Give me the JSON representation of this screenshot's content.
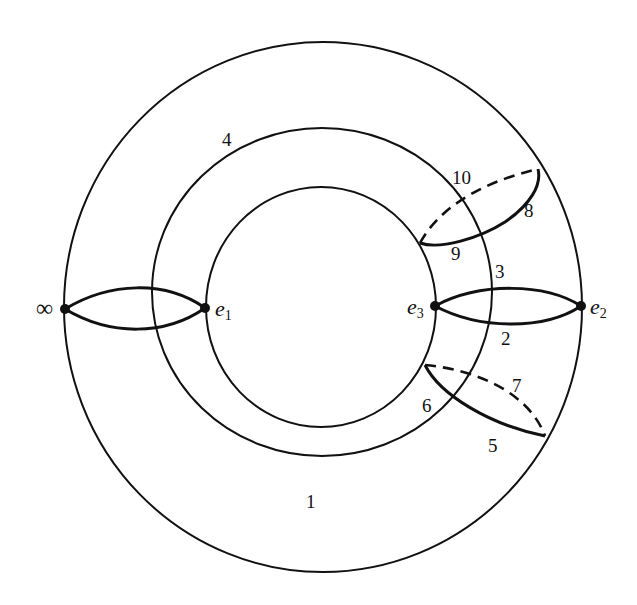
{
  "figure": {
    "circles": [
      {
        "id": "outer",
        "label": "1"
      },
      {
        "id": "middle",
        "label": "4"
      },
      {
        "id": "inner",
        "label": ""
      }
    ],
    "points": [
      {
        "id": "infinity",
        "label": "∞"
      },
      {
        "id": "e1",
        "label": "e",
        "subscript": "1"
      },
      {
        "id": "e3",
        "label": "e",
        "subscript": "3"
      },
      {
        "id": "e2",
        "label": "e",
        "subscript": "2"
      }
    ],
    "path_labels": [
      "1",
      "2",
      "3",
      "4",
      "5",
      "6",
      "7",
      "8",
      "9",
      "10"
    ],
    "labels": {
      "l1": "1",
      "l2": "2",
      "l3": "3",
      "l4": "4",
      "l5": "5",
      "l6": "6",
      "l7": "7",
      "l8": "8",
      "l9": "9",
      "l10": "10",
      "infinity": "∞",
      "e1_base": "e",
      "e1_sub": "1",
      "e2_base": "e",
      "e2_sub": "2",
      "e3_base": "e",
      "e3_sub": "3"
    }
  }
}
